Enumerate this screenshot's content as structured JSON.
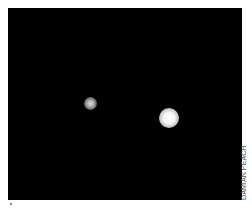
{
  "image": {
    "description": "Telescope photograph of two bright celestial bodies against a black sky",
    "background_color": "#000000",
    "objects": [
      {
        "name": "small-body",
        "color": "#b8b8b8"
      },
      {
        "name": "large-body",
        "color": "#f4f4f4"
      }
    ]
  },
  "credit": {
    "text": "DAMIAN PEACH"
  },
  "footer": {
    "mark": "."
  }
}
